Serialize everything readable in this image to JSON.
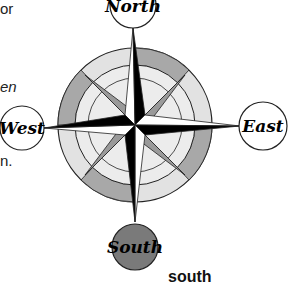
{
  "fragments": {
    "line1": "or",
    "line2": "en",
    "line3": "n."
  },
  "compass": {
    "north_label": "North",
    "east_label": "East",
    "south_label": "South",
    "west_label": "West",
    "colors": {
      "dark_ring": "#a8a8a8",
      "light_ring": "#e2e2e2",
      "inner_fill": "#ececec",
      "star_dark": "#000000",
      "star_mid": "#9a9a9a",
      "south_fill": "#7a7a7a"
    }
  },
  "caption": "south"
}
